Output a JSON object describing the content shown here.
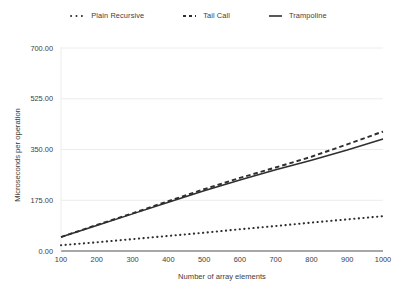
{
  "chart_data": {
    "type": "line",
    "title": "",
    "xlabel": "Number of array elements",
    "ylabel": "Microseconds per operation",
    "x": [
      100,
      200,
      300,
      400,
      500,
      600,
      700,
      800,
      900,
      1000
    ],
    "xlim": [
      100,
      1000
    ],
    "ylim": [
      0,
      700
    ],
    "xticks": [
      "100",
      "200",
      "300",
      "400",
      "500",
      "600",
      "700",
      "800",
      "900",
      "1000"
    ],
    "yticks": [
      "0.00",
      "175.00",
      "350.00",
      "525.00",
      "700.00"
    ],
    "ytick_values": [
      0,
      175,
      350,
      525,
      700
    ],
    "grid": true,
    "legend_position": "top-center",
    "series": [
      {
        "name": "Plain Recursive",
        "style": "dotted",
        "color": "#2f2f2f",
        "values": [
          20,
          30,
          41,
          52,
          63,
          75,
          86,
          98,
          109,
          120
        ]
      },
      {
        "name": "Tail Call",
        "style": "dashed",
        "color": "#2f2f2f",
        "values": [
          48,
          90,
          130,
          172,
          213,
          252,
          288,
          325,
          368,
          412
        ]
      },
      {
        "name": "Trampoline",
        "style": "solid",
        "color": "#2f2f2f",
        "values": [
          48,
          88,
          128,
          168,
          208,
          245,
          280,
          313,
          348,
          386
        ]
      }
    ]
  },
  "colors": {
    "grid": "#ececed",
    "axis": "#8a8a8a",
    "text": "#3d3d3d",
    "line": "#2f2f2f",
    "background": "#ffffff"
  }
}
